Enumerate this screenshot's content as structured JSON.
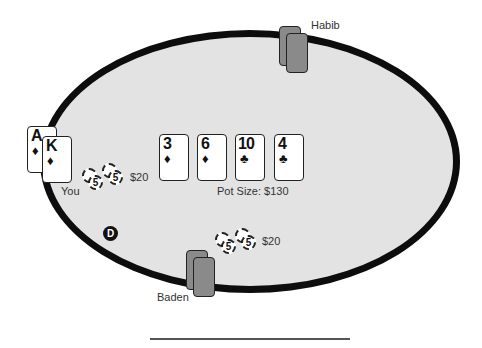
{
  "players": {
    "habib": {
      "name": "Habib"
    },
    "you": {
      "name": "You",
      "hole_cards": [
        {
          "rank": "A",
          "suit": "♦"
        },
        {
          "rank": "K",
          "suit": "♦"
        }
      ],
      "bet": "$20",
      "chip_value": "5"
    },
    "baden": {
      "name": "Baden",
      "bet": "$20",
      "chip_value": "5"
    }
  },
  "board": {
    "cards": [
      {
        "rank": "3",
        "suit": "♦"
      },
      {
        "rank": "6",
        "suit": "♦"
      },
      {
        "rank": "10",
        "suit": "♣"
      },
      {
        "rank": "4",
        "suit": "♣"
      }
    ],
    "pot_label": "Pot Size: $130"
  },
  "dealer_button": {
    "label": "D"
  },
  "colors": {
    "felt": "#e3e3e3",
    "rail": "#0d0d0d",
    "card_back": "#8a8a8a"
  }
}
